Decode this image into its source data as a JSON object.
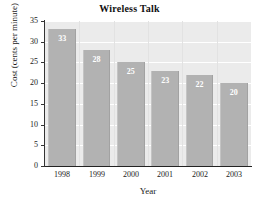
{
  "chart_data": {
    "type": "bar",
    "title": "Wireless Talk",
    "xlabel": "Year",
    "ylabel": "Cost (cents per minute)",
    "categories": [
      "1998",
      "1999",
      "2000",
      "2001",
      "2002",
      "2003"
    ],
    "values": [
      33,
      28,
      25,
      23,
      22,
      20
    ],
    "value_labels": [
      "33",
      "28",
      "25",
      "23",
      "22",
      "20"
    ],
    "ylim": [
      0,
      35
    ],
    "ytick_labels": [
      "35",
      "30",
      "25",
      "20",
      "15",
      "10",
      "5",
      "0"
    ],
    "ytick_values": [
      35,
      30,
      25,
      20,
      15,
      10,
      5,
      0
    ],
    "grid": true,
    "grid_orientation": "horizontal",
    "legend": null,
    "colors": {
      "bar": "#b2b2b2",
      "plot_background": "#ebebeb",
      "gridline": "#ffffff",
      "axis": "#222222",
      "value_label": "#ffffff",
      "text": "#1a1a1a",
      "figure_background": "#ffffff"
    }
  }
}
